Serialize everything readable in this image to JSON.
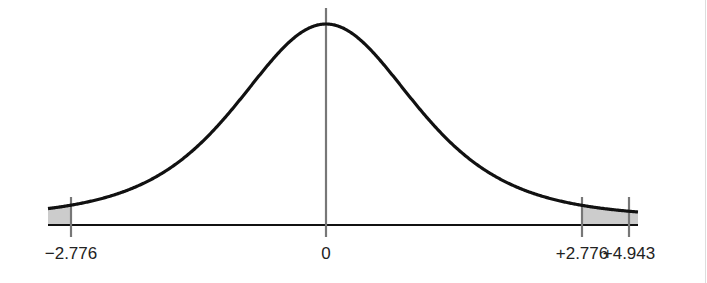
{
  "chart_data": {
    "type": "area",
    "title": "",
    "xlabel": "",
    "ylabel": "",
    "tick_labels": [
      "−2.776",
      "0",
      "+2.776",
      "+4.943"
    ],
    "markers": [
      {
        "label": "−2.776",
        "value": -2.776
      },
      {
        "label": "0",
        "value": 0
      },
      {
        "label": "+2.776",
        "value": 2.776
      },
      {
        "label": "+4.943",
        "value": 4.943
      }
    ],
    "shaded_regions": [
      {
        "from": "left-edge",
        "to": -2.776
      },
      {
        "from": 2.776,
        "to": "right-edge"
      }
    ],
    "colors": {
      "curve": "#111111",
      "shade": "#cccccc",
      "marker": "#777777",
      "axis": "#111111"
    }
  }
}
